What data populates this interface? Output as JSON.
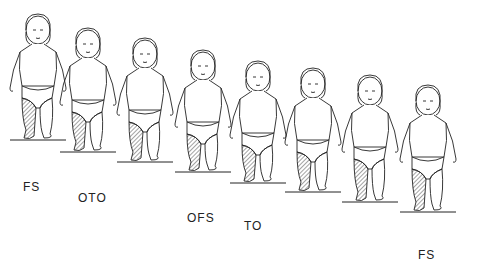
{
  "figure": {
    "figures": [
      {
        "x": 38,
        "y": 8,
        "ground_y": 140
      },
      {
        "x": 88,
        "y": 22,
        "ground_y": 152
      },
      {
        "x": 145,
        "y": 32,
        "ground_y": 162
      },
      {
        "x": 203,
        "y": 44,
        "ground_y": 172
      },
      {
        "x": 258,
        "y": 55,
        "ground_y": 183
      },
      {
        "x": 313,
        "y": 62,
        "ground_y": 192
      },
      {
        "x": 370,
        "y": 69,
        "ground_y": 202
      },
      {
        "x": 428,
        "y": 79,
        "ground_y": 212
      }
    ],
    "labels": [
      {
        "text": "FS",
        "x": 23,
        "y": 180
      },
      {
        "text": "OTO",
        "x": 78,
        "y": 191
      },
      {
        "text": "OFS",
        "x": 187,
        "y": 211
      },
      {
        "text": "TO",
        "x": 244,
        "y": 219
      },
      {
        "text": "FS",
        "x": 418,
        "y": 248
      }
    ]
  }
}
